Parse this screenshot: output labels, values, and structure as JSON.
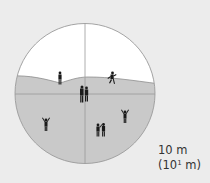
{
  "diagram": {
    "colors": {
      "background": "#ececec",
      "sky": "#ffffff",
      "ground": "#c9c9c9",
      "outline": "#9a9a9a",
      "figures": "#1a1a1a"
    },
    "scale_label": {
      "line1": "10 m",
      "line2_prefix": "(10",
      "line2_exponent": "1",
      "line2_suffix": " m)"
    },
    "figures": [
      {
        "name": "standing-person-left-hill",
        "x": 60,
        "y": 82
      },
      {
        "name": "running-person-right-hill",
        "x": 112,
        "y": 80
      },
      {
        "name": "couple-center",
        "x": 84,
        "y": 99
      },
      {
        "name": "person-arms-raised-left",
        "x": 46,
        "y": 127
      },
      {
        "name": "couple-lower-right",
        "x": 101,
        "y": 134
      },
      {
        "name": "person-arms-raised-right",
        "x": 125,
        "y": 119
      }
    ]
  }
}
